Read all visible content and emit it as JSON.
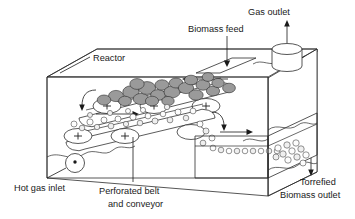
{
  "figure": {
    "type": "process-schematic",
    "background_color": "#ffffff",
    "line_color": "#2b2b2b",
    "biomass_color": "#9a9a9a",
    "torrefied_color": "#fdfdfd"
  },
  "labels": {
    "gas_outlet": "Gas outlet",
    "biomass_feed": "Biomass feed",
    "reactor": "Reactor",
    "hot_gas_inlet": "Hot gas inlet",
    "perforated_belt_line1": "Perforated belt",
    "perforated_belt_line2": "and conveyor",
    "torrefied_outlet_line1": "Torrefied",
    "torrefied_outlet_line2": "Biomass outlet"
  },
  "components": {
    "roller_marker": "+",
    "upper_belt_rollers": 3,
    "lower_belt_rollers": 3,
    "gas_outlet_stack": "cylinder",
    "hot_gas_inlet_port": "circle-with-dot",
    "feed_chute": "parallelogram",
    "flow_arrows": 6
  }
}
